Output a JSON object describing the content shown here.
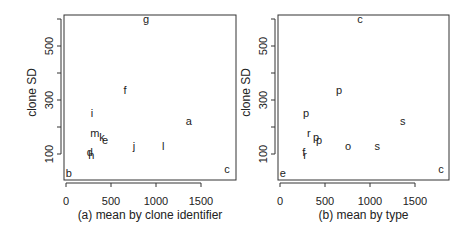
{
  "chart_data": [
    {
      "type": "scatter",
      "title": "",
      "xlabel": "(a) mean by clone identifier",
      "ylabel": "clone SD",
      "xlim": [
        0,
        1850
      ],
      "ylim": [
        20,
        620
      ],
      "xticks": [
        0,
        500,
        1000,
        1500
      ],
      "yticks": [
        100,
        300,
        500
      ],
      "grid": false,
      "legend": null,
      "marker": "text-label",
      "points": [
        {
          "label": "g",
          "x": 890,
          "y": 600
        },
        {
          "label": "f",
          "x": 655,
          "y": 337
        },
        {
          "label": "i",
          "x": 290,
          "y": 252
        },
        {
          "label": "a",
          "x": 1365,
          "y": 222
        },
        {
          "label": "m",
          "x": 320,
          "y": 178
        },
        {
          "label": "k",
          "x": 400,
          "y": 163
        },
        {
          "label": "e",
          "x": 435,
          "y": 152
        },
        {
          "label": "j",
          "x": 755,
          "y": 130
        },
        {
          "label": "l",
          "x": 1080,
          "y": 130
        },
        {
          "label": "d",
          "x": 265,
          "y": 107
        },
        {
          "label": "h",
          "x": 280,
          "y": 97
        },
        {
          "label": "b",
          "x": 30,
          "y": 30
        },
        {
          "label": "c",
          "x": 1790,
          "y": 45
        }
      ]
    },
    {
      "type": "scatter",
      "title": "",
      "xlabel": "(b) mean by type",
      "ylabel": "clone SD",
      "xlim": [
        0,
        1850
      ],
      "ylim": [
        20,
        620
      ],
      "xticks": [
        0,
        500,
        1000,
        1500
      ],
      "yticks": [
        100,
        300,
        500
      ],
      "grid": false,
      "legend": null,
      "marker": "text-label",
      "points": [
        {
          "label": "c",
          "x": 890,
          "y": 600
        },
        {
          "label": "p",
          "x": 655,
          "y": 337
        },
        {
          "label": "p",
          "x": 290,
          "y": 252
        },
        {
          "label": "s",
          "x": 1365,
          "y": 222
        },
        {
          "label": "r",
          "x": 320,
          "y": 178
        },
        {
          "label": "p",
          "x": 400,
          "y": 163
        },
        {
          "label": "p",
          "x": 435,
          "y": 152
        },
        {
          "label": "o",
          "x": 755,
          "y": 130
        },
        {
          "label": "s",
          "x": 1080,
          "y": 130
        },
        {
          "label": "f",
          "x": 265,
          "y": 107
        },
        {
          "label": "r",
          "x": 280,
          "y": 97
        },
        {
          "label": "e",
          "x": 30,
          "y": 30
        },
        {
          "label": "c",
          "x": 1790,
          "y": 45
        }
      ]
    }
  ],
  "panels": [
    {
      "id": "a",
      "left": 64,
      "right": 236,
      "top": 15,
      "bottom": 180,
      "x0px": 66,
      "xscale": 0.09,
      "y100px": 154,
      "yscale": 0.27
    },
    {
      "id": "b",
      "left": 278,
      "right": 449,
      "top": 15,
      "bottom": 180,
      "x0px": 280,
      "xscale": 0.09,
      "y100px": 154,
      "yscale": 0.27
    }
  ],
  "colors": {
    "ink": "#222222",
    "background": "#ffffff"
  }
}
